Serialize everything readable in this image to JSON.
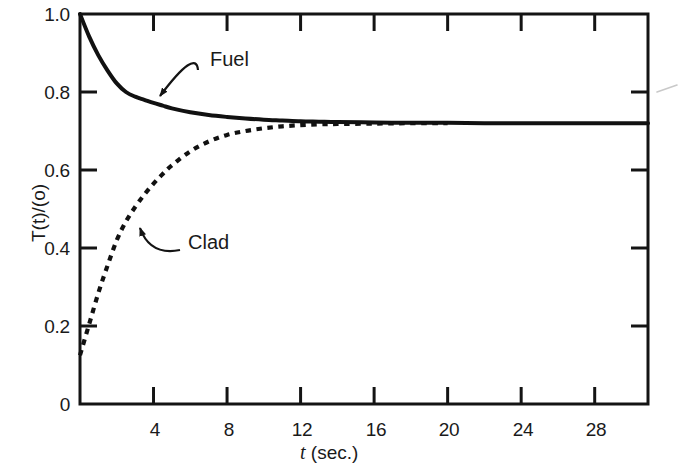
{
  "chart_data": {
    "type": "line",
    "title": "",
    "xlabel": "t (sec.)",
    "xlabel_italic_part": "t",
    "xlabel_rest": " (sec.)",
    "ylabel": "T(t)/(o)",
    "xlim": [
      0,
      30.9
    ],
    "ylim": [
      0,
      1.0
    ],
    "grid": false,
    "legend_position": "inline-annotations",
    "xticks": [
      4,
      8,
      12,
      16,
      20,
      24,
      28
    ],
    "xtick_labels": [
      "4",
      "8",
      "12",
      "16",
      "20",
      "24",
      "28"
    ],
    "yticks": [
      0,
      0.2,
      0.4,
      0.6,
      0.8,
      1.0
    ],
    "ytick_labels": [
      "0",
      "0.2",
      "0.4",
      "0.6",
      "0.8",
      "1.0"
    ],
    "ticks_on_top_axis": true,
    "ticks_on_right_axis": true,
    "asymptote_value": 0.72,
    "series": [
      {
        "name": "Fuel",
        "style": "solid",
        "color": "#111111",
        "annotation_label": "Fuel",
        "x": [
          0.0,
          0.5,
          1.0,
          1.5,
          2.0,
          2.5,
          3.0,
          3.5,
          4.0,
          4.5,
          5.0,
          6.0,
          7.0,
          8.0,
          9.0,
          10.0,
          11.0,
          12.0,
          13.0,
          14.0,
          16.0,
          18.0,
          20.0,
          22.0,
          24.0,
          26.0,
          28.0,
          30.9
        ],
        "y": [
          1.0,
          0.942,
          0.894,
          0.855,
          0.822,
          0.8,
          0.788,
          0.78,
          0.772,
          0.765,
          0.758,
          0.748,
          0.741,
          0.736,
          0.732,
          0.729,
          0.727,
          0.725,
          0.724,
          0.723,
          0.722,
          0.721,
          0.721,
          0.72,
          0.72,
          0.72,
          0.72,
          0.72
        ]
      },
      {
        "name": "Clad",
        "style": "dashed",
        "color": "#111111",
        "annotation_label": "Clad",
        "x": [
          0.0,
          0.5,
          1.0,
          1.5,
          2.0,
          2.5,
          3.0,
          3.5,
          4.0,
          4.5,
          5.0,
          6.0,
          7.0,
          8.0,
          9.0,
          10.0,
          11.0,
          12.0,
          13.0,
          14.0,
          16.0,
          18.0,
          20.0
        ],
        "y": [
          0.125,
          0.205,
          0.285,
          0.355,
          0.42,
          0.468,
          0.505,
          0.537,
          0.565,
          0.59,
          0.612,
          0.648,
          0.673,
          0.69,
          0.7,
          0.707,
          0.712,
          0.715,
          0.717,
          0.718,
          0.719,
          0.72,
          0.72
        ]
      }
    ],
    "annotations": [
      {
        "label": "Fuel",
        "label_x_px": 210,
        "label_y_px": 58,
        "arrow_from_px": [
          198,
          70
        ],
        "arrow_to_px": [
          160,
          96
        ]
      },
      {
        "label": "Clad",
        "label_x_px": 188,
        "label_y_px": 241,
        "arrow_from_px": [
          180,
          250
        ],
        "arrow_to_px": [
          140,
          228
        ]
      }
    ]
  },
  "axis": {
    "y_title": "T(t)/(o)",
    "x_title_italic": "t",
    "x_title_rest": " (sec.)"
  }
}
